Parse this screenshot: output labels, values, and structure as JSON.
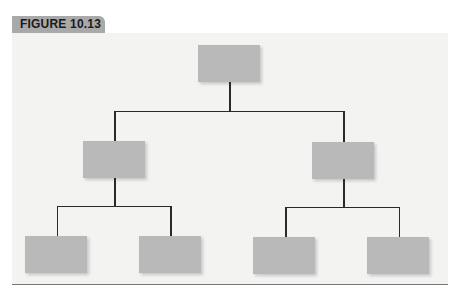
{
  "figure": {
    "label": "FIGURE 10.13"
  },
  "diagram": {
    "type": "org-chart-hierarchy",
    "colors": {
      "box_fill": "#b9b9b9",
      "line": "#2a2a2a",
      "panel_bg": "#f3f3f2",
      "tab_bg": "#a9a9a9"
    },
    "nodes": [
      {
        "id": "root",
        "level": 0,
        "label": ""
      },
      {
        "id": "mid-left",
        "level": 1,
        "parent": "root",
        "label": ""
      },
      {
        "id": "mid-right",
        "level": 1,
        "parent": "root",
        "label": ""
      },
      {
        "id": "leaf-1",
        "level": 2,
        "parent": "mid-left",
        "label": ""
      },
      {
        "id": "leaf-2",
        "level": 2,
        "parent": "mid-left",
        "label": ""
      },
      {
        "id": "leaf-3",
        "level": 2,
        "parent": "mid-right",
        "label": ""
      },
      {
        "id": "leaf-4",
        "level": 2,
        "parent": "mid-right",
        "label": ""
      }
    ]
  }
}
